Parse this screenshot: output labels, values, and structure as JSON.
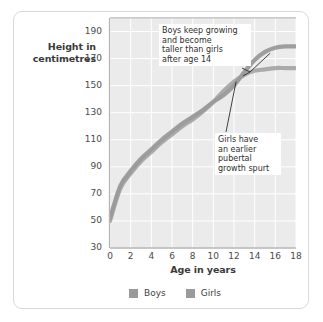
{
  "figure": {
    "background": "#ffffff",
    "frame_border_color": "#d9d9d9"
  },
  "chart_data": {
    "type": "line",
    "title": "",
    "xlabel": "Age in years",
    "ylabel": "Height in\ncentimetres",
    "xlim": [
      0,
      18
    ],
    "ylim": [
      30,
      200
    ],
    "xticks": [
      "0",
      "2",
      "4",
      "6",
      "8",
      "10",
      "12",
      "14",
      "16",
      "18"
    ],
    "yticks": [
      "30",
      "50",
      "70",
      "90",
      "110",
      "130",
      "150",
      "170",
      "190"
    ],
    "grid": true,
    "grid_color": "#ffffff",
    "plot_background": "#ebebeb",
    "legend_position": "bottom",
    "x": [
      0,
      1,
      2,
      3,
      4,
      5,
      6,
      7,
      8,
      9,
      10,
      11,
      12,
      13,
      14,
      15,
      16,
      17,
      18
    ],
    "series": [
      {
        "name": "Boys",
        "color": "#9a9a9a",
        "values": [
          52,
          76,
          87,
          96,
          103,
          110,
          116,
          122,
          127,
          132,
          138,
          143,
          150,
          160,
          169,
          175,
          178,
          179,
          179
        ]
      },
      {
        "name": "Girls",
        "color": "#9a9a9a",
        "values": [
          50,
          74,
          85,
          94,
          101,
          108,
          114,
          120,
          125,
          131,
          138,
          146,
          153,
          158,
          161,
          162,
          163,
          163,
          163
        ]
      }
    ],
    "annotations": [
      {
        "id": "boys-note",
        "text": "Boys keep growing\nand become\ntaller than girls\nafter age 14",
        "points_to": {
          "age": 15.5,
          "height": 174
        }
      },
      {
        "id": "girls-note",
        "text": "Girls have\nan earlier\npubertal\ngrowth spurt",
        "points_to": {
          "age": 12.2,
          "height": 153
        }
      }
    ]
  },
  "legend": {
    "items": [
      {
        "label": "Boys",
        "color": "#9a9a9a"
      },
      {
        "label": "Girls",
        "color": "#9a9a9a"
      }
    ]
  }
}
